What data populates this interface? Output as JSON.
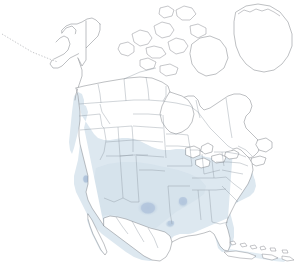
{
  "map": {
    "title": "North America species range map",
    "background_color": "#ffffff",
    "projection_note": "Lambert-style conic, North America",
    "outline_color": "#6e7278",
    "admin_boundary_color": "#8b949e",
    "land_fill_color": "#ffffff",
    "range_fill_color": "#dde8f0",
    "range_fill_mid_color": "#cfdeea",
    "hotspot_color": "#b8c8dc",
    "hotspot_strong_color": "#a9bcd4"
  },
  "legend": {
    "shown": false,
    "range_label": "",
    "hotspot_label": ""
  },
  "regions": {
    "shaded": [
      "Southern United States",
      "Central United States",
      "Southwestern United States",
      "Pacific Coast",
      "Mid-Atlantic",
      "Florida",
      "Mexico",
      "Cuba",
      "Hispaniola",
      "Bahamas"
    ],
    "unshaded": [
      "Alaska",
      "Northern Canada",
      "Canadian Arctic Archipelago",
      "Greenland",
      "Great Lakes region",
      "New England",
      "Northern Plains"
    ]
  },
  "hotspots": [
    {
      "name": "texas-panhandle-oklahoma",
      "cx": 148,
      "cy": 208,
      "rx": 11,
      "ry": 8
    },
    {
      "name": "missouri-arkansas",
      "cx": 183,
      "cy": 202,
      "rx": 6,
      "ry": 6
    },
    {
      "name": "san-francisco-bay",
      "cx": 86,
      "cy": 179,
      "rx": 4,
      "ry": 5
    },
    {
      "name": "south-texas-rio-grande",
      "cx": 158,
      "cy": 245,
      "rx": 6,
      "ry": 5
    },
    {
      "name": "gulf-coast-louisiana",
      "cx": 170,
      "cy": 224,
      "rx": 5,
      "ry": 4
    }
  ],
  "features": {
    "greenland": "Greenland",
    "alaska": "Alaska",
    "aleutian_islands": "Aleutian Islands",
    "hudson_bay": "Hudson Bay",
    "great_lakes": "Great Lakes",
    "baffin_island": "Baffin Island",
    "cuba": "Cuba",
    "baja_california": "Baja California",
    "florida_peninsula": "Florida"
  }
}
